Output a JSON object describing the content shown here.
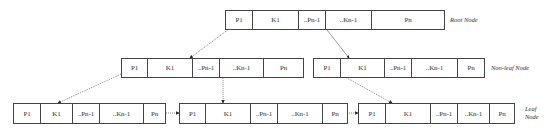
{
  "diagram": {
    "type": "B+ tree structure",
    "labels": {
      "root": "Root Node",
      "non_leaf": "Non-leaf Node",
      "leaf_line1": "Leaf",
      "leaf_line2": "Node"
    },
    "root_node": {
      "cells": [
        "P1",
        "K1",
        "..Pn-1",
        "..Kn-1",
        "Pn"
      ]
    },
    "non_leaf_nodes": [
      {
        "cells": [
          "P1",
          "K1",
          "..Pn-1",
          "..Kn-1",
          "Pn"
        ]
      },
      {
        "cells": [
          "P1",
          "K1",
          "..Pn-1",
          "..Kn-1",
          "Pn"
        ]
      }
    ],
    "leaf_nodes": [
      {
        "cells": [
          "P1",
          "K1",
          "..Pn-1",
          "..Kn-1",
          "Pn"
        ]
      },
      {
        "cells": [
          "P1",
          "K1",
          "..Pn-1",
          "..Kn-1",
          "Pn"
        ]
      },
      {
        "cells": [
          "P1",
          "K1",
          "..Pn-1",
          "..Kn-1",
          "Pn"
        ]
      }
    ],
    "edges": [
      {
        "from": "root.P1",
        "to": "non_leaf_0",
        "style": "dotted"
      },
      {
        "from": "root.Pn-1",
        "to": "non_leaf_1",
        "style": "solid"
      },
      {
        "from": "non_leaf_0.P1",
        "to": "leaf_0",
        "style": "dotted"
      },
      {
        "from": "non_leaf_0.Pn-1",
        "to": "leaf_1",
        "style": "dotted"
      },
      {
        "from": "non_leaf_1.P1",
        "to": "leaf_2",
        "style": "dotted"
      },
      {
        "from": "leaf_0.Pn",
        "to": "leaf_1",
        "style": "dotted"
      },
      {
        "from": "leaf_1.Pn",
        "to": "leaf_2",
        "style": "dotted"
      }
    ],
    "colors": {
      "line": "#444444",
      "text": "#333333",
      "background": "#ffffff"
    }
  }
}
